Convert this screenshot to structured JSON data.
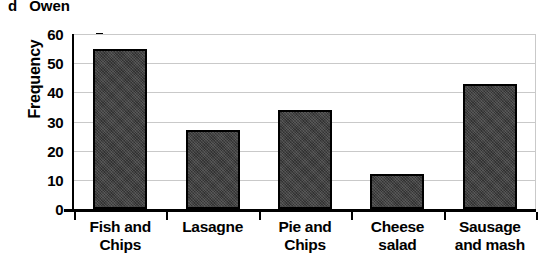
{
  "question": {
    "letter": "d",
    "name": "Owen"
  },
  "chart_data": {
    "type": "bar",
    "title": "",
    "xlabel": "",
    "ylabel": "Frequency",
    "categories": [
      "Fish and Chips",
      "Lasagne",
      "Pie and Chips",
      "Cheese salad",
      "Sausage and mash"
    ],
    "category_lines": [
      [
        "Fish and",
        "Chips"
      ],
      [
        "Lasagne",
        ""
      ],
      [
        "Pie and",
        "Chips"
      ],
      [
        "Cheese",
        "salad"
      ],
      [
        "Sausage",
        "and mash"
      ]
    ],
    "values": [
      55,
      27,
      34,
      12,
      43
    ],
    "ylim": [
      0,
      60
    ],
    "ytick_labels": [
      "0",
      "10",
      "20",
      "30",
      "40",
      "50",
      "60"
    ],
    "ytick_values": [
      0,
      10,
      20,
      30,
      40,
      50,
      60
    ],
    "grid": "horizontal",
    "legend": "none",
    "bar_color": "#3c3c3c",
    "bar_edge_color": "#000000",
    "grid_color": "#c9c9c9",
    "axis_color": "#000000"
  }
}
